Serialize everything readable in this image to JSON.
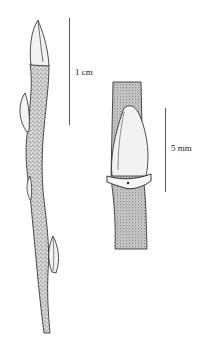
{
  "figure": {
    "scale_bars": [
      {
        "label": "1 cm"
      },
      {
        "label": "5 mm"
      }
    ]
  }
}
